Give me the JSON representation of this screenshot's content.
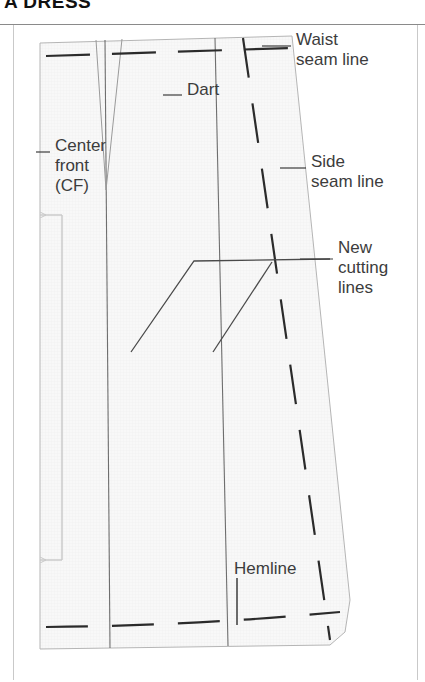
{
  "header": {
    "title": "A DRESS"
  },
  "figure": {
    "name": "skirt-pattern-diagram",
    "colors": {
      "ink": "#3c3c3c",
      "line": "#2b2b2b",
      "pattern_fill": "#f7f7f7",
      "pattern_edge": "#b5b5b5",
      "grid": "#e6e6e6",
      "grainline": "#c8c8c8",
      "rule": "#8a8a8a",
      "frame": "#c9c9c9"
    }
  },
  "labels": {
    "waist_seam_line": "Waist\nseam line",
    "dart": "Dart",
    "center_front": "Center\nfront\n(CF)",
    "side_seam_line": "Side\nseam line",
    "new_cutting_lines": "New\ncutting\nlines",
    "hemline": "Hemline"
  },
  "elements": {
    "waist_seam": "dashed-horizontal-line",
    "center_front_line": "solid-vertical-line",
    "princess_line": "solid-vertical-line",
    "dart_shape": "narrow-v-dart",
    "side_seam": "dashed-slanted-line",
    "cutting_line_left": "diagonal-to-horizontal",
    "cutting_line_right": "diagonal-to-horizontal",
    "hemline_dashed": "dashed-curved-line",
    "grainline_arrow": "double-headed-vertical-arrow"
  }
}
